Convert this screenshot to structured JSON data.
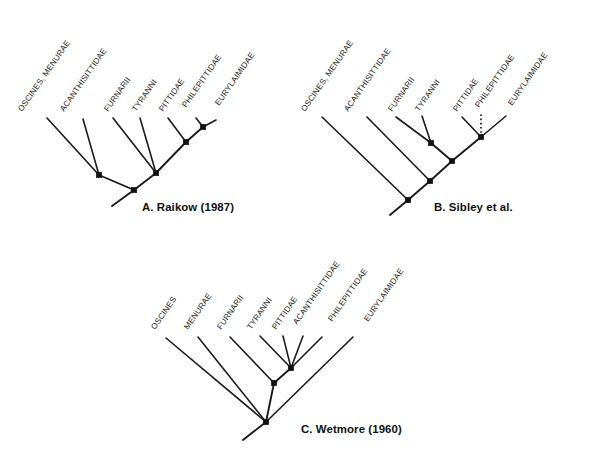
{
  "figure": {
    "background_color": "#ffffff",
    "line_color": "#1a1a1a",
    "node_color": "#111111",
    "width": 601,
    "height": 465,
    "label_rotation_deg": -55,
    "node_size": 5.4
  },
  "panels": [
    {
      "id": "panel-a",
      "caption": "A. Raikow (1987)",
      "caption_x": 142,
      "caption_y": 211,
      "tips": [
        {
          "name": "OSCINES, MENURAE",
          "label_x": 22,
          "label_y": 112,
          "tip_x": 47,
          "tip_y": 118
        },
        {
          "name": "ACANTHISITTIDAE",
          "label_x": 64,
          "label_y": 112,
          "tip_x": 83,
          "tip_y": 119
        },
        {
          "name": "FURNARII",
          "label_x": 108,
          "label_y": 112,
          "tip_x": 113,
          "tip_y": 118
        },
        {
          "name": "TYRANNI",
          "label_x": 136,
          "label_y": 112,
          "tip_x": 140,
          "tip_y": 118
        },
        {
          "name": "PITTIDAE",
          "label_x": 163,
          "label_y": 112,
          "tip_x": 168,
          "tip_y": 118
        },
        {
          "name": "PHILEPITTIDAE",
          "label_x": 186,
          "label_y": 108,
          "tip_x": 196,
          "tip_y": 118
        },
        {
          "name": "EURYLAIMIDAE",
          "label_x": 219,
          "label_y": 106,
          "tip_x": 216,
          "tip_y": 120
        }
      ],
      "nodes": [
        {
          "id": "a-root",
          "x": 134,
          "y": 190
        },
        {
          "id": "a-n1",
          "x": 99,
          "y": 175
        },
        {
          "id": "a-n2",
          "x": 156,
          "y": 173
        },
        {
          "id": "a-n3",
          "x": 186,
          "y": 142
        },
        {
          "id": "a-n4",
          "x": 203,
          "y": 127
        }
      ],
      "node_markers": [
        "a-root",
        "a-n1",
        "a-n2",
        "a-n3",
        "a-n4"
      ],
      "root_stem": {
        "x1": 134,
        "y1": 190,
        "x2": 112,
        "y2": 206
      },
      "edges": [
        {
          "from": "a-root",
          "to": "a-n1",
          "style": "solid"
        },
        {
          "from": "a-root",
          "to": "a-n2",
          "style": "solid"
        },
        {
          "from": "a-n2",
          "to": "a-n3",
          "style": "solid"
        },
        {
          "from": "a-n3",
          "to": "a-n4",
          "style": "solid"
        }
      ],
      "tip_edges": [
        {
          "from": "a-n1",
          "tip": 0,
          "style": "solid"
        },
        {
          "from": "a-n1",
          "tip": 1,
          "style": "solid"
        },
        {
          "from": "a-n2",
          "tip": 2,
          "style": "solid"
        },
        {
          "from": "a-n2",
          "tip": 3,
          "style": "solid"
        },
        {
          "from": "a-n3",
          "tip": 4,
          "style": "solid"
        },
        {
          "from": "a-n4",
          "tip": 5,
          "style": "solid"
        },
        {
          "from": "a-n4",
          "tip": 6,
          "style": "solid"
        }
      ]
    },
    {
      "id": "panel-b",
      "caption": "B. Sibley et al.",
      "caption_x": 434,
      "caption_y": 211,
      "tips": [
        {
          "name": "OSCINES, MENURAE",
          "label_x": 305,
          "label_y": 112,
          "tip_x": 322,
          "tip_y": 117
        },
        {
          "name": "ACANTHISITTIDAE",
          "label_x": 348,
          "label_y": 112,
          "tip_x": 367,
          "tip_y": 117
        },
        {
          "name": "FURNARII",
          "label_x": 392,
          "label_y": 112,
          "tip_x": 396,
          "tip_y": 117
        },
        {
          "name": "TYRANNI",
          "label_x": 419,
          "label_y": 112,
          "tip_x": 422,
          "tip_y": 116
        },
        {
          "name": "PITTIDAE",
          "label_x": 457,
          "label_y": 112,
          "tip_x": 462,
          "tip_y": 117
        },
        {
          "name": "PHILEPITTIDAE",
          "label_x": 479,
          "label_y": 108,
          "tip_x": 481,
          "tip_y": 113
        },
        {
          "name": "EURYLAIMIDAE",
          "label_x": 512,
          "label_y": 106,
          "tip_x": 506,
          "tip_y": 116
        }
      ],
      "nodes": [
        {
          "id": "b-root",
          "x": 408,
          "y": 200
        },
        {
          "id": "b-n1",
          "x": 430,
          "y": 181
        },
        {
          "id": "b-n2",
          "x": 452,
          "y": 161
        },
        {
          "id": "b-n3",
          "x": 431,
          "y": 143
        },
        {
          "id": "b-n4",
          "x": 481,
          "y": 137
        }
      ],
      "node_markers": [
        "b-root",
        "b-n1",
        "b-n2",
        "b-n3",
        "b-n4"
      ],
      "root_stem": {
        "x1": 408,
        "y1": 200,
        "x2": 390,
        "y2": 215
      },
      "edges": [
        {
          "from": "b-root",
          "to": "b-n1",
          "style": "solid"
        },
        {
          "from": "b-n1",
          "to": "b-n2",
          "style": "solid"
        },
        {
          "from": "b-n2",
          "to": "b-n3",
          "style": "solid"
        },
        {
          "from": "b-n2",
          "to": "b-n4",
          "style": "solid"
        }
      ],
      "tip_edges": [
        {
          "from": "b-root",
          "tip": 0,
          "style": "solid"
        },
        {
          "from": "b-n1",
          "tip": 1,
          "style": "solid"
        },
        {
          "from": "b-n3",
          "tip": 2,
          "style": "solid"
        },
        {
          "from": "b-n3",
          "tip": 3,
          "style": "solid"
        },
        {
          "from": "b-n4",
          "tip": 4,
          "style": "solid"
        },
        {
          "from": "b-n4",
          "tip": 5,
          "style": "dotted"
        },
        {
          "from": "b-n4",
          "tip": 6,
          "style": "solid"
        }
      ]
    },
    {
      "id": "panel-c",
      "caption": "C. Wetmore (1960)",
      "caption_x": 301,
      "caption_y": 433,
      "tips": [
        {
          "name": "OSCINES",
          "label_x": 155,
          "label_y": 330,
          "tip_x": 166,
          "tip_y": 338
        },
        {
          "name": "MENURAE",
          "label_x": 188,
          "label_y": 330,
          "tip_x": 198,
          "tip_y": 337
        },
        {
          "name": "FURNARII",
          "label_x": 221,
          "label_y": 330,
          "tip_x": 230,
          "tip_y": 337
        },
        {
          "name": "TYRANNI",
          "label_x": 251,
          "label_y": 330,
          "tip_x": 260,
          "tip_y": 336
        },
        {
          "name": "PITTIDAE",
          "label_x": 276,
          "label_y": 330,
          "tip_x": 283,
          "tip_y": 336
        },
        {
          "name": "ACANTHISITTIDAE",
          "label_x": 297,
          "label_y": 325,
          "tip_x": 303,
          "tip_y": 336
        },
        {
          "name": "PHILEPITTIDAE",
          "label_x": 332,
          "label_y": 322,
          "tip_x": 322,
          "tip_y": 337
        },
        {
          "name": "EURYLAIMIDAE",
          "label_x": 368,
          "label_y": 322,
          "tip_x": 353,
          "tip_y": 337
        }
      ],
      "nodes": [
        {
          "id": "c-root",
          "x": 266,
          "y": 422
        },
        {
          "id": "c-n1",
          "x": 274,
          "y": 383
        },
        {
          "id": "c-n2",
          "x": 291,
          "y": 368
        }
      ],
      "node_markers": [
        "c-root",
        "c-n1",
        "c-n2"
      ],
      "root_stem": {
        "x1": 266,
        "y1": 422,
        "x2": 243,
        "y2": 440
      },
      "edges": [
        {
          "from": "c-root",
          "to": "c-n1",
          "style": "solid"
        },
        {
          "from": "c-n1",
          "to": "c-n2",
          "style": "solid"
        }
      ],
      "tip_edges": [
        {
          "from": "c-root",
          "tip": 0,
          "style": "solid"
        },
        {
          "from": "c-root",
          "tip": 1,
          "style": "solid"
        },
        {
          "from": "c-n1",
          "tip": 2,
          "style": "solid"
        },
        {
          "from": "c-n2",
          "tip": 3,
          "style": "solid"
        },
        {
          "from": "c-n2",
          "tip": 4,
          "style": "solid"
        },
        {
          "from": "c-n2",
          "tip": 5,
          "style": "solid"
        },
        {
          "from": "c-n2",
          "tip": 6,
          "style": "solid"
        },
        {
          "from": "c-root",
          "tip": 7,
          "style": "solid"
        }
      ]
    }
  ]
}
